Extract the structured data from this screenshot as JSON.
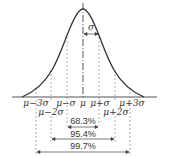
{
  "diagram": {
    "sigma_label": "σ",
    "x_labels_upper": [
      {
        "text": "μ−3σ",
        "x": 36
      },
      {
        "text": "μ−σ",
        "x": 67
      },
      {
        "text": "μ",
        "x": 83
      },
      {
        "text": "μ+σ",
        "x": 99
      },
      {
        "text": "μ+3σ",
        "x": 130
      }
    ],
    "x_labels_lower": [
      {
        "text": "μ−2σ",
        "x": 51
      },
      {
        "text": "μ+2σ",
        "x": 115
      }
    ],
    "intervals": [
      {
        "label": "68.3%",
        "from": "μ−σ",
        "to": "μ+σ"
      },
      {
        "label": "95.4%",
        "from": "μ−2σ",
        "to": "μ+2σ"
      },
      {
        "label": "99.7%",
        "from": "μ−3σ",
        "to": "μ+3σ"
      }
    ],
    "colors": {
      "curve": "#333333",
      "dashed": "#999999",
      "text": "#333333"
    }
  }
}
